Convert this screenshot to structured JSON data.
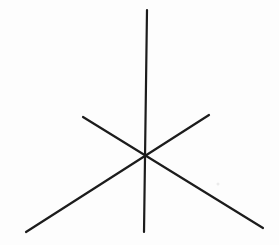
{
  "figure": {
    "background_color": "#fdfdfd",
    "stroke_color": "#1c1c1c",
    "stroke_width": 2.2,
    "center": {
      "x": 146,
      "y": 155
    },
    "lines": [
      {
        "name": "vertical-axis-line",
        "x1": 147,
        "y1": 10,
        "x2": 144,
        "y2": 232
      },
      {
        "name": "diagonal-line-upperleft-to-lowerright",
        "x1": 83,
        "y1": 117,
        "x2": 263,
        "y2": 228
      },
      {
        "name": "diagonal-line-lowerleft-to-upperright",
        "x1": 26,
        "y1": 232,
        "x2": 209,
        "y2": 115
      }
    ],
    "specks": [
      {
        "x": 218,
        "y": 184,
        "r": 1.5,
        "color": "#ebebeb"
      }
    ]
  }
}
